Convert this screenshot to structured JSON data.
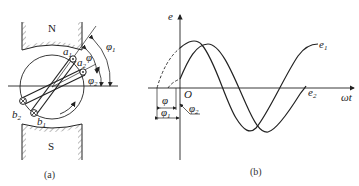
{
  "figure_a": {
    "caption": "(a)",
    "pole_north": "N",
    "pole_south": "S",
    "labels": {
      "a1": "a",
      "a1_sub": "1",
      "a2": "a",
      "a2_sub": "2",
      "b1": "b",
      "b1_sub": "1",
      "b2": "b",
      "b2_sub": "2",
      "phi": "φ",
      "phi1": "φ",
      "phi1_sub": "1",
      "phi2": "φ",
      "phi2_sub": "2"
    }
  },
  "figure_b": {
    "caption": "(b)",
    "y_axis_label": "e",
    "x_axis_label": "ωt",
    "origin_label": "O",
    "curve1_label": "e",
    "curve1_sub": "1",
    "curve2_label": "e",
    "curve2_sub": "2",
    "phi": "φ",
    "phi1": "φ",
    "phi1_sub": "1",
    "phi2": "φ",
    "phi2_sub": "2"
  },
  "colors": {
    "stroke": "#222222",
    "hatch": "#555555",
    "background": "#ffffff"
  }
}
